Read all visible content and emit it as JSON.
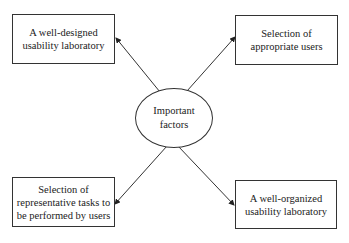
{
  "diagram": {
    "center": {
      "label_line1": "Important",
      "label_line2": "factors"
    },
    "nodes": [
      {
        "position": "top-left",
        "line1": "A well-designed",
        "line2": "usability laboratory",
        "line3": ""
      },
      {
        "position": "top-right",
        "line1": "Selection of",
        "line2": "appropriate users",
        "line3": ""
      },
      {
        "position": "bottom-left",
        "line1": "Selection of",
        "line2": "representative tasks to",
        "line3": "be performed by users"
      },
      {
        "position": "bottom-right",
        "line1": "A well-organized",
        "line2": "usability laboratory",
        "line3": ""
      }
    ],
    "edges": [
      {
        "from": "center",
        "to": "top-left"
      },
      {
        "from": "center",
        "to": "top-right"
      },
      {
        "from": "center",
        "to": "bottom-left"
      },
      {
        "from": "center",
        "to": "bottom-right"
      }
    ]
  }
}
